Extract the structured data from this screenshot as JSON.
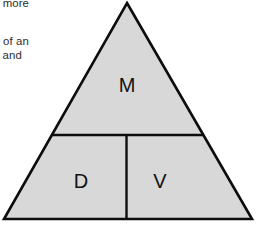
{
  "page": {
    "background_color": "#ffffff",
    "width": 257,
    "height": 228
  },
  "body_text": {
    "lines": [
      "is more",
      "y of an",
      ", and"
    ]
  },
  "diagram": {
    "type": "triangle-formula-mnemonic",
    "fill_color": "#d8d8d8",
    "stroke_color": "#0d0d0d",
    "apex": {
      "x": 127,
      "y": 3
    },
    "bottom_left": {
      "x": 4,
      "y": 219
    },
    "bottom_right": {
      "x": 252,
      "y": 219
    },
    "horizontal_divider_y": 135,
    "vertical_divider_x": 126.5,
    "cells": [
      {
        "id": "top",
        "label": "M"
      },
      {
        "id": "bottom-left",
        "label": "D"
      },
      {
        "id": "bottom-right",
        "label": "V"
      }
    ]
  }
}
